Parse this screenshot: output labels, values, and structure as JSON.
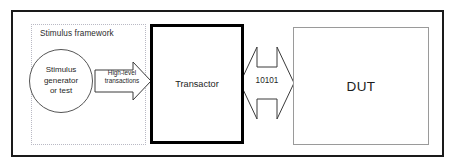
{
  "diagram": {
    "frame": {
      "name": "outer-frame",
      "border_color": "#1a1a1a"
    },
    "framework": {
      "label": "Stimulus framework",
      "border_color": "#b9b9c4",
      "border_style": "dotted"
    },
    "generator": {
      "line1": "Stimulus",
      "line2": "generator",
      "line3": "or test",
      "shape": "circle",
      "border_color": "#555555"
    },
    "high_level_arrow": {
      "line1": "High-level",
      "line2": "transactions",
      "direction": "right",
      "shape": "block-arrow",
      "stroke_color": "#3a3a3a"
    },
    "transactor": {
      "label": "Transactor",
      "border_color": "#000000",
      "border_width": "3px"
    },
    "bus_arrow": {
      "label": "10101",
      "direction": "bidirectional",
      "shape": "double-block-arrow",
      "stroke_color": "#3a3a3a"
    },
    "dut": {
      "label": "DUT",
      "border_color": "#9a9a9a"
    }
  }
}
